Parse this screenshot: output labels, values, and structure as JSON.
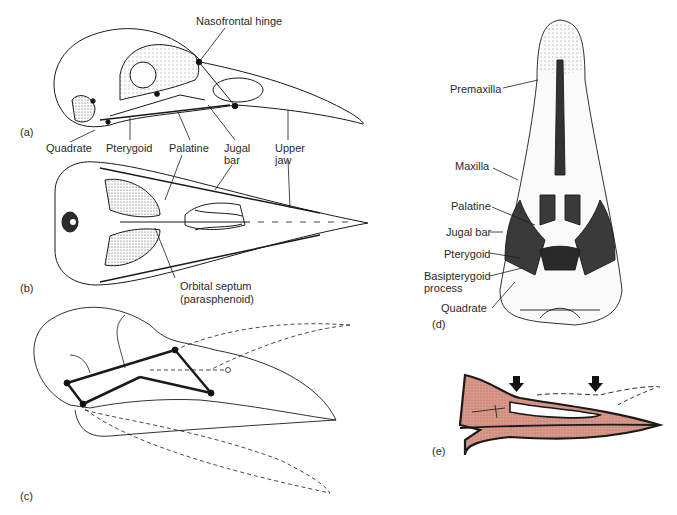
{
  "figure": {
    "panels": [
      {
        "id": "a",
        "label": "(a)",
        "view": "lateral skull"
      },
      {
        "id": "b",
        "label": "(b)",
        "view": "ventral skull"
      },
      {
        "id": "c",
        "label": "(c)",
        "view": "kinetic linkage diagram"
      },
      {
        "id": "d",
        "label": "(d)",
        "view": "ventral palate"
      },
      {
        "id": "e",
        "label": "(e)",
        "view": "rhynchokinetic beak section"
      }
    ],
    "labels_ab": {
      "nasofrontal_hinge": "Nasofrontal hinge",
      "quadrate": "Quadrate",
      "pterygoid": "Pterygoid",
      "palatine": "Palatine",
      "jugal_bar_1": "Jugal",
      "jugal_bar_2": "bar",
      "upper_jaw_1": "Upper",
      "upper_jaw_2": "jaw",
      "orbital_septum_1": "Orbital septum",
      "orbital_septum_2": "(parasphenoid)"
    },
    "labels_d": {
      "premaxilla": "Premaxilla",
      "maxilla": "Maxilla",
      "palatine": "Palatine",
      "jugal_bar": "Jugal bar",
      "pterygoid": "Pterygoid",
      "basipterygoid_1": "Basipterygoid",
      "basipterygoid_2": "process",
      "quadrate": "Quadrate"
    },
    "colors": {
      "ink": "#1a1a1a",
      "stipple": "#555555",
      "dark_fill": "#3a3a3a",
      "beak_fill": "#d9988a"
    }
  }
}
